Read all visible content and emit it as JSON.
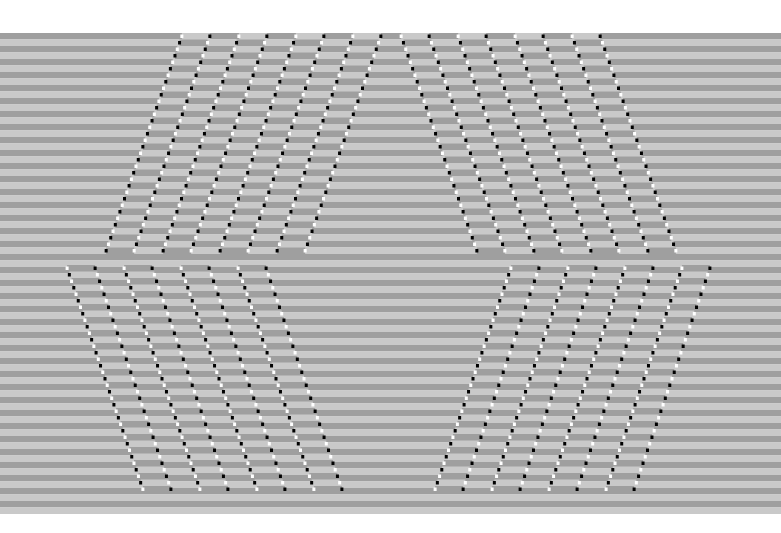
{
  "artwork": {
    "type": "optical-illusion",
    "description": "Horizontal gray stripes with diagonal shifted bands bordered by black and white dots",
    "colors": {
      "background": "#ffffff",
      "stripe_light": "#c9c9c9",
      "stripe_dark": "#9f9f9f",
      "dot_black": "#000000",
      "dot_white": "#ffffff"
    },
    "stripes": {
      "top": 33,
      "bottom": 506,
      "period": 13,
      "left": 0,
      "right": 781
    },
    "top_half": {
      "y_start": 33,
      "y_end": 256,
      "left_bands_x_top": [
        183,
        240,
        297,
        354
      ],
      "left_bands_x_bottom": [
        105,
        162,
        219,
        276
      ],
      "right_bands_x_top": [
        400,
        457,
        514,
        571
      ],
      "right_bands_x_bottom": [
        478,
        535,
        592,
        649
      ],
      "band_width": 28
    },
    "bottom_half": {
      "y_start": 265,
      "y_end": 490,
      "left_bands_x_top": [
        66,
        123,
        180,
        237
      ],
      "left_bands_x_bottom": [
        144,
        201,
        258,
        315
      ],
      "right_bands_x_top": [
        512,
        569,
        626,
        683
      ],
      "right_bands_x_bottom": [
        434,
        491,
        548,
        605
      ],
      "band_width": 28
    }
  }
}
